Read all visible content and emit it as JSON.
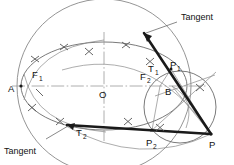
{
  "figure": {
    "canvas": {
      "width": 234,
      "height": 165
    },
    "colors": {
      "background": "#ffffff",
      "thin_line": "#6b6b6b",
      "axis_line": "#9a9a9a",
      "thick_line": "#1a1a1a",
      "text": "#111111",
      "mark": "#555555"
    }
  },
  "labels": {
    "vertex_a": "A",
    "focus_1": "F",
    "focus_1_sub": "1",
    "focus_2": "F",
    "focus_2_sub": "2",
    "center": "O",
    "point_b": "B",
    "tangent_point_1": "T",
    "tangent_point_1_sub": "1",
    "tangent_point_2": "T",
    "tangent_point_2_sub": "2",
    "aux_point_1": "P",
    "aux_point_1_sub": "1",
    "aux_point_2": "P",
    "aux_point_2_sub": "2",
    "external_point": "P",
    "tangent_top": "Tangent",
    "tangent_bottom": "Tangent"
  },
  "geometry": {
    "ellipse": {
      "cx": 104,
      "cy": 86,
      "rx": 83,
      "ry": 44
    },
    "director_circle": {
      "cx": 104,
      "cy": 86,
      "r": 87
    },
    "small_circle": {
      "cx": 180,
      "cy": 107,
      "r": 36
    },
    "points": {
      "A": {
        "x": 21,
        "y": 86
      },
      "O": {
        "x": 104,
        "y": 86
      },
      "F1": {
        "x": 34,
        "y": 86
      },
      "F2": {
        "x": 160,
        "y": 86
      },
      "B": {
        "x": 172,
        "y": 86
      },
      "T1": {
        "x": 164,
        "y": 71
      },
      "T2": {
        "x": 70,
        "y": 124
      },
      "P1": {
        "x": 171,
        "y": 69
      },
      "P2": {
        "x": 152,
        "y": 130
      },
      "P": {
        "x": 211,
        "y": 134
      }
    },
    "tangent_top_leader": {
      "x1": 177,
      "y1": 22,
      "x2": 143,
      "y2": 32
    },
    "tangent_bottom_leader": {
      "x1": 46,
      "y1": 139,
      "x2": 66,
      "y2": 127
    }
  }
}
